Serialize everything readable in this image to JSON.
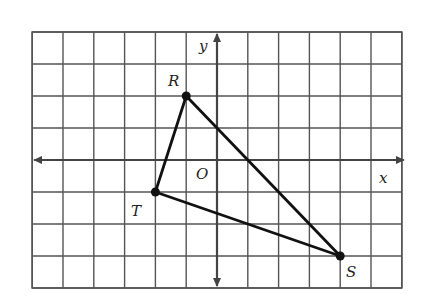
{
  "diagram": {
    "type": "coordinate-plane-triangle",
    "grid": {
      "x_min": -6,
      "x_max": 6,
      "y_min": -4,
      "y_max": 4,
      "origin_px": [
        217,
        160
      ],
      "unit_px_x": 30.8,
      "unit_px_y": 32
    },
    "axes": {
      "x_label": "x",
      "y_label": "y",
      "origin_label": "O"
    },
    "vertices": [
      {
        "name": "R",
        "x": -1,
        "y": 2
      },
      {
        "name": "T",
        "x": -2,
        "y": -1
      },
      {
        "name": "S",
        "x": 4,
        "y": -3
      }
    ],
    "edges": [
      [
        "R",
        "S"
      ],
      [
        "S",
        "T"
      ],
      [
        "T",
        "R"
      ]
    ],
    "colors": {
      "grid": "#555555",
      "axis": "#444444",
      "triangle": "#111111",
      "background": "#ffffff"
    }
  }
}
